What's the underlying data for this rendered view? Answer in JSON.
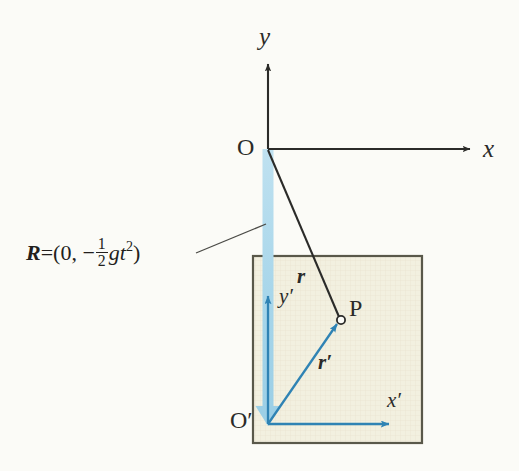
{
  "figure": {
    "type": "physics-vector-diagram",
    "background_color": "#fbfbf7",
    "description_title": "Position vectors in inertial and accelerating (free-falling) frames"
  },
  "colors": {
    "ink": "#2b2b29",
    "blue_accent": "#2f83b4",
    "blue_light": "#a9d6ea",
    "box_fill": "#f2f0e0",
    "box_border": "#59584a"
  },
  "labels": {
    "y_axis": "y",
    "x_axis": "x",
    "origin": "O",
    "origin_prime": "O′",
    "y_axis_prime": "y′",
    "x_axis_prime": "x′",
    "point_p": "P",
    "vector_r": "r",
    "vector_r_prime": "r′"
  },
  "formula": {
    "vector_symbol": "R",
    "equals": "=",
    "open_paren": "(",
    "first_component": "0,",
    "minus": "−",
    "numerator": "1",
    "denominator": "2",
    "g_symbol": "g",
    "t_symbol": "t",
    "t_exponent": "2",
    "close_paren": ")",
    "plain_text": "R = (0, −½ gt²)"
  },
  "geometry": {
    "origin_O": {
      "x": 268,
      "y": 149
    },
    "origin_O_prime": {
      "x": 268,
      "y": 424
    },
    "point_P": {
      "x": 341,
      "y": 320
    },
    "y_axis_tip": {
      "x": 268,
      "y": 60
    },
    "x_axis_tip": {
      "x": 476,
      "y": 149
    },
    "y_prime_tip": {
      "x": 268,
      "y": 292
    },
    "x_prime_tip": {
      "x": 394,
      "y": 424
    },
    "box": {
      "left": 253,
      "top": 256,
      "right": 422,
      "bottom": 443
    },
    "leader_line": {
      "x1": 196,
      "y1": 253,
      "x2": 266,
      "y2": 224
    }
  }
}
